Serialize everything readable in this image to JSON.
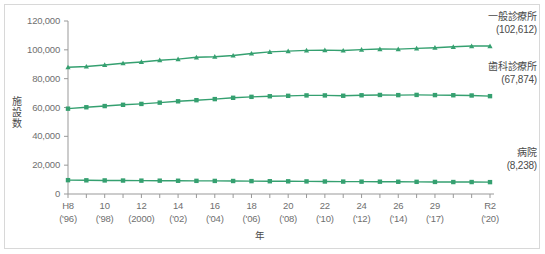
{
  "chart_data": {
    "type": "line",
    "title": "",
    "xlabel": "年",
    "ylabel": "施設数",
    "ylim": [
      0,
      120000
    ],
    "ytick_values": [
      0,
      20000,
      40000,
      60000,
      80000,
      100000,
      120000
    ],
    "ytick_labels": [
      "0",
      "20,000",
      "40,000",
      "60,000",
      "80,000",
      "100,000",
      "120,000"
    ],
    "grid": false,
    "legend_position": "right-inline",
    "x": [
      "H8",
      "9",
      "10",
      "11",
      "12",
      "13",
      "14",
      "15",
      "16",
      "17",
      "18",
      "19",
      "20",
      "21",
      "22",
      "23",
      "24",
      "25",
      "26",
      "27",
      "29",
      "30",
      "R1",
      "R2"
    ],
    "xtick_labels": [
      {
        "line1": "H8",
        "line2": "('96)",
        "index": 0
      },
      {
        "line1": "10",
        "line2": "('98)",
        "index": 2
      },
      {
        "line1": "12",
        "line2": "(2000)",
        "index": 4
      },
      {
        "line1": "14",
        "line2": "('02)",
        "index": 6
      },
      {
        "line1": "16",
        "line2": "('04)",
        "index": 8
      },
      {
        "line1": "18",
        "line2": "('06)",
        "index": 10
      },
      {
        "line1": "20",
        "line2": "('08)",
        "index": 12
      },
      {
        "line1": "22",
        "line2": "('10)",
        "index": 14
      },
      {
        "line1": "24",
        "line2": "('12)",
        "index": 16
      },
      {
        "line1": "26",
        "line2": "('14)",
        "index": 18
      },
      {
        "line1": "29",
        "line2": "('17)",
        "index": 20
      },
      {
        "line1": "R2",
        "line2": "('20)",
        "index": 23
      }
    ],
    "series": [
      {
        "name": "一般診療所",
        "end_value_label": "(102,612)",
        "end_value": 102612,
        "marker": "triangle",
        "color": "#35a070",
        "values": [
          87909,
          88442,
          89500,
          90663,
          91606,
          92824,
          93544,
          94819,
          95227,
          96050,
          97442,
          98609,
          99083,
          99635,
          99824,
          99547,
          100152,
          100528,
          100461,
          100995,
          101471,
          102105,
          102616,
          102612
        ]
      },
      {
        "name": "歯科診療所",
        "end_value_label": "(67,874)",
        "end_value": 67874,
        "marker": "square",
        "color": "#35a070",
        "values": [
          59186,
          60168,
          61000,
          61869,
          62484,
          63361,
          64297,
          65073,
          65828,
          66732,
          67392,
          67798,
          68097,
          68384,
          68384,
          68156,
          68474,
          68701,
          68592,
          68737,
          68609,
          68500,
          68328,
          67874
        ]
      },
      {
        "name": "病院",
        "end_value_label": "(8,238)",
        "end_value": 8238,
        "marker": "square",
        "color": "#35a070",
        "values": [
          9606,
          9490,
          9413,
          9333,
          9266,
          9239,
          9187,
          9122,
          9077,
          9026,
          8943,
          8862,
          8794,
          8739,
          8670,
          8605,
          8565,
          8540,
          8493,
          8442,
          8372,
          8300,
          8300,
          8238
        ]
      }
    ]
  },
  "axis": {
    "y_label_chars": [
      "施",
      "設",
      "数"
    ],
    "x_label": "年"
  },
  "colors": {
    "series": "#35a070",
    "axis": "#999999",
    "text": "#6f6f6f",
    "frame": "#d8d8d8",
    "background": "#ffffff"
  }
}
